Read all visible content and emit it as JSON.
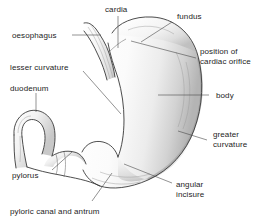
{
  "figure": {
    "background_color": "#ffffff",
    "line_color": "#3a3a3a",
    "leader_color": "#4a4a4a",
    "text_color": "#1d1d1d",
    "shading_light": "#f2f2f2",
    "shading_mid": "#cfcfcf",
    "shading_dark": "#a8a8a8"
  },
  "labels": {
    "cardia": "cardia",
    "fundus": "fundus",
    "oesophagus": "oesophagus",
    "position_of_cardiac_orifice_line1": "position of",
    "position_of_cardiac_orifice_line2": "cardiac orifice",
    "lesser_curvature": "lesser curvature",
    "duodenum": "duodenum",
    "body": "body",
    "greater_curvature_line1": "greater",
    "greater_curvature_line2": "curvature",
    "pylorus": "pylorus",
    "angular_incisure_line1": "angular",
    "angular_incisure_line2": "incisure",
    "pyloric_canal_and_antrum": "pyloric canal and antrum"
  }
}
